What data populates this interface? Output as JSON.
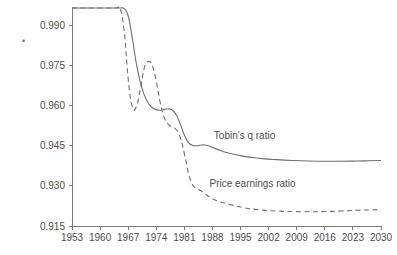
{
  "chart_data": {
    "type": "line",
    "title": "",
    "subtitle": "",
    "xlabel": "",
    "ylabel": "",
    "grid": false,
    "legend_position": "inline-annotation",
    "xlim": [
      1953,
      2030
    ],
    "ylim": [
      0.915,
      0.9965
    ],
    "xticks": [
      1953,
      1960,
      1967,
      1974,
      1981,
      1988,
      1995,
      2002,
      2009,
      2016,
      2023,
      2030
    ],
    "xtick_labels": [
      "1953",
      "1960",
      "1967",
      "1974",
      "1981",
      "1988",
      "1995",
      "2002",
      "2009",
      "2016",
      "2023",
      "2030"
    ],
    "yticks": [
      0.915,
      0.93,
      0.945,
      0.96,
      0.975,
      0.99
    ],
    "ytick_labels": [
      "0.915",
      "0.930",
      "0.945",
      "0.960",
      "0.975",
      "0.990"
    ],
    "annotations": [
      {
        "text": "Tobin's q ratio",
        "x": 1996,
        "y": 0.9475
      },
      {
        "text": "Price earnings ratio",
        "x": 1998,
        "y": 0.9295
      }
    ],
    "series": [
      {
        "name": "Tobin's q ratio",
        "style": "solid",
        "color": "#6e6e6e",
        "x": [
          1953,
          1956,
          1959,
          1962,
          1964,
          1965,
          1966,
          1967,
          1968,
          1969,
          1970,
          1971,
          1972,
          1973,
          1974,
          1975,
          1976,
          1977,
          1978,
          1979,
          1980,
          1981,
          1982,
          1983,
          1984,
          1985,
          1986,
          1987,
          1988,
          1990,
          1992,
          1995,
          1998,
          2001,
          2004,
          2008,
          2012,
          2016,
          2020,
          2024,
          2027,
          2030
        ],
        "y": [
          0.9965,
          0.9965,
          0.9965,
          0.9965,
          0.9965,
          0.9965,
          0.9963,
          0.9935,
          0.9855,
          0.976,
          0.969,
          0.964,
          0.961,
          0.9592,
          0.9585,
          0.9583,
          0.9586,
          0.9588,
          0.9583,
          0.9565,
          0.953,
          0.949,
          0.9462,
          0.9452,
          0.945,
          0.9452,
          0.9453,
          0.945,
          0.9444,
          0.9432,
          0.9423,
          0.9413,
          0.9406,
          0.9401,
          0.9398,
          0.9395,
          0.9393,
          0.9392,
          0.9392,
          0.9393,
          0.9394,
          0.9395
        ]
      },
      {
        "name": "Price earnings ratio",
        "style": "dashed",
        "color": "#6e6e6e",
        "x": [
          1953,
          1960,
          1964,
          1965,
          1966,
          1967,
          1968,
          1969,
          1970,
          1971,
          1972,
          1973,
          1974,
          1975,
          1976,
          1977,
          1978,
          1979,
          1980,
          1981,
          1982,
          1983,
          1984,
          1985,
          1986,
          1988,
          1990,
          1993,
          1996,
          2000,
          2004,
          2008,
          2012,
          2016,
          2020,
          2024,
          2027,
          2030
        ],
        "y": [
          0.9965,
          0.9965,
          0.9965,
          0.9963,
          0.988,
          0.97,
          0.9597,
          0.9595,
          0.966,
          0.974,
          0.9765,
          0.975,
          0.969,
          0.961,
          0.9555,
          0.953,
          0.952,
          0.951,
          0.948,
          0.942,
          0.935,
          0.9305,
          0.929,
          0.9283,
          0.9272,
          0.9252,
          0.924,
          0.9228,
          0.9218,
          0.921,
          0.9206,
          0.9204,
          0.9203,
          0.9204,
          0.9206,
          0.9209,
          0.921,
          0.9211
        ]
      }
    ]
  },
  "marks": {
    "corner_dot": "•"
  }
}
